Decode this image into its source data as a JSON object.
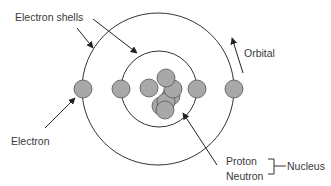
{
  "diagram": {
    "labels": {
      "electron_shells": "Electron shells",
      "orbital": "Orbital",
      "electron": "Electron",
      "proton": "Proton",
      "neutron": "Neutron",
      "nucleus": "Nucleus"
    },
    "colors": {
      "line": "#333333",
      "particle_fill": "#a8a8a8",
      "particle_stroke": "#555555",
      "text": "#3a3a3a"
    }
  }
}
